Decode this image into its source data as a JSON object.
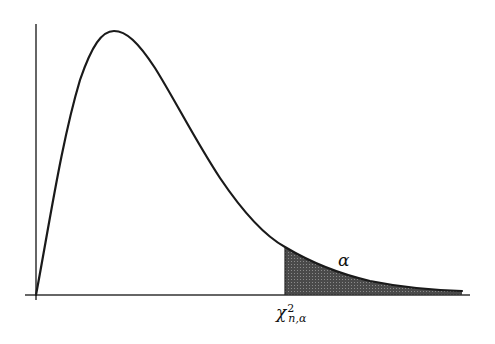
{
  "diagram": {
    "curve": "chi-square density",
    "shaded_region": "upper tail area",
    "labels": {
      "tail_area": "α",
      "critical_value_symbol": "χ",
      "critical_value_superscript": "2",
      "critical_value_subscript": "n,α"
    },
    "colors": {
      "curve": "#1a1a1a",
      "axes": "#333333",
      "shading": "#555555"
    }
  }
}
